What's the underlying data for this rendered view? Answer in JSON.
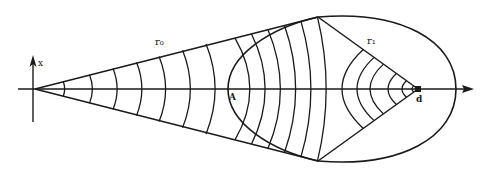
{
  "diagram": {
    "type": "wavefront-construction",
    "labels": {
      "axis_x": "x",
      "r0": "r₀",
      "r1": "r₁",
      "point_A": "A",
      "point_d": "d"
    },
    "colors": {
      "stroke": "#1a1a1a",
      "background": "#ffffff"
    },
    "left_fan_arc_count": 7,
    "right_fan_arc_count": 11,
    "inner_region_arc_count": 6
  }
}
